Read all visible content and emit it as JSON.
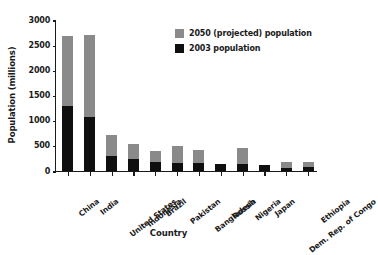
{
  "chart_data": {
    "type": "bar",
    "subtype": "stacked",
    "title": "",
    "xlabel": "Country",
    "ylabel": "Population (millions)",
    "ylim": [
      0,
      3000
    ],
    "yticks": [
      0,
      500,
      1000,
      1500,
      2000,
      2500,
      3000
    ],
    "ytick_labels": [
      "0",
      "500",
      "1000",
      "1500",
      "2000",
      "2500",
      "3000"
    ],
    "grid": false,
    "legend_position": "upper right",
    "categories": [
      "China",
      "India",
      "United States",
      "Indonesia",
      "Brazil",
      "Pakistan",
      "Bangladesh",
      "Russia",
      "Nigeria",
      "Japan",
      "Dem. Rep. of Congo",
      "Ethiopia"
    ],
    "series": [
      {
        "name": "2003 population",
        "color": "#0f0f0f",
        "values": [
          1300,
          1070,
          290,
          230,
          180,
          150,
          150,
          145,
          135,
          128,
          55,
          70
        ]
      },
      {
        "name": "2050 (projected) population",
        "color": "#8a8a8a",
        "values": [
          2680,
          2700,
          720,
          540,
          400,
          500,
          410,
          145,
          450,
          128,
          180,
          175
        ]
      }
    ],
    "legend": [
      {
        "label": "2050 (projected) population",
        "color": "#8a8a8a"
      },
      {
        "label": "2003 population",
        "color": "#0f0f0f"
      }
    ]
  }
}
